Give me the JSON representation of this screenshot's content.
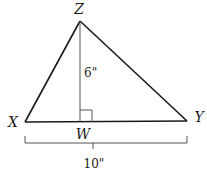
{
  "diagram": {
    "type": "triangle",
    "vertices": {
      "Z": {
        "label": "Z",
        "x": 80,
        "y": 21
      },
      "X": {
        "label": "X",
        "x": 25,
        "y": 122
      },
      "Y": {
        "label": "Y",
        "x": 187,
        "y": 121
      },
      "W": {
        "label": "W",
        "x": 80,
        "y": 122
      }
    },
    "height_label": "6\"",
    "base_label": "10\"",
    "colors": {
      "stroke": "#1a1a1a",
      "altitude": "#555555",
      "bracket": "#555555"
    }
  }
}
